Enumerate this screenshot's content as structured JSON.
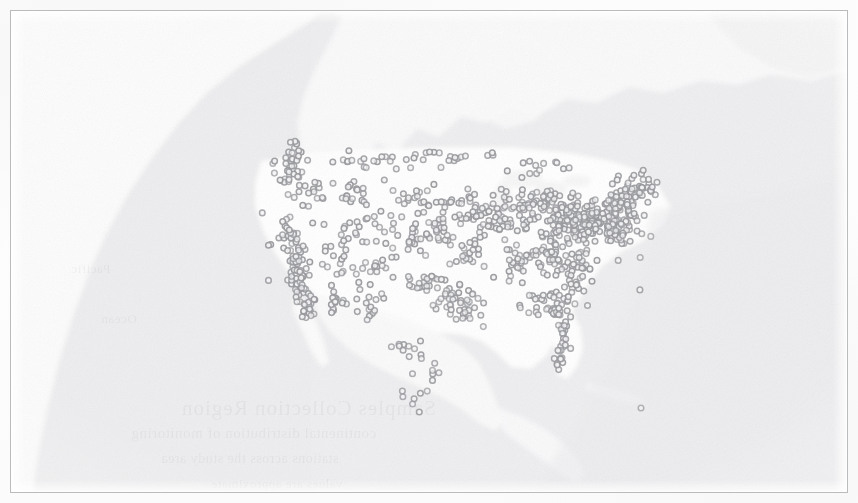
{
  "figure": {
    "title": "",
    "caption": "",
    "kind": "dot-density scatter map",
    "region_label": "North America",
    "border_color": "#b9bbbd",
    "background_color": "#fcfcfc",
    "ocean_color": "#efeff0",
    "land_color": "#fdfdfd",
    "marker_color": "#9a9b9f",
    "marker_fill": "#f3f3f4",
    "marker_radius_px": 2.8,
    "marker_count": 612,
    "scan_artifact": "bleed-through ghost text from reverse page, illegible"
  },
  "ghost_text": {
    "line1": "Samples Collection Region",
    "line2": "continental distribution of monitoring",
    "line3": "stations across the study area",
    "line4": "values are approximate",
    "line5": "Pacific",
    "line6": "Ocean"
  },
  "chart_data": {
    "type": "scatter",
    "title": "Dot-density map of sampling locations across North America",
    "subtitle": "",
    "xlabel": "Longitude",
    "ylabel": "Latitude",
    "xlim": [
      -170,
      -50
    ],
    "ylim": [
      8,
      72
    ],
    "grid": false,
    "legend": null,
    "projection": "equirectangular (approx.)",
    "series": [
      {
        "name": "Sampling locations",
        "marker": "open circle",
        "color": "#9a9b9f",
        "point_count": 612,
        "density_notes": [
          "Highest density: Northeast / Mid-Atlantic corridor (Boston-New York-Washington)",
          "Secondary cluster: Great Lakes / Midwest (Chicago-Detroit-Cleveland)",
          "Secondary cluster: Pacific coast of California (San Francisco-Los Angeles-San Diego)",
          "Linear chain along Florida peninsula",
          "Sparse scatter across Mountain West and Great Plains",
          "Thin trail of points extending south into Mexico",
          "One isolated point in the western Atlantic",
          "No points in Canada north of the border band, none in Alaska"
        ]
      }
    ],
    "clusters": [
      {
        "label": "Northeast corridor",
        "approx_points": 170,
        "cx_pct": 69,
        "cy_pct": 44
      },
      {
        "label": "Great Lakes / Midwest",
        "approx_points": 95,
        "cx_pct": 57,
        "cy_pct": 42
      },
      {
        "label": "California coast",
        "approx_points": 70,
        "cx_pct": 33,
        "cy_pct": 50
      },
      {
        "label": "Southeast / Florida",
        "approx_points": 60,
        "cx_pct": 63,
        "cy_pct": 62
      },
      {
        "label": "Texas / Gulf",
        "approx_points": 45,
        "cx_pct": 50,
        "cy_pct": 60
      },
      {
        "label": "Pacific Northwest",
        "approx_points": 35,
        "cx_pct": 32,
        "cy_pct": 32
      },
      {
        "label": "Mountain West / Plains",
        "approx_points": 110,
        "cx_pct": 45,
        "cy_pct": 45
      },
      {
        "label": "Mexico trail",
        "approx_points": 22,
        "cx_pct": 47,
        "cy_pct": 76
      },
      {
        "label": "Atlantic outlier",
        "approx_points": 1,
        "cx_pct": 75,
        "cy_pct": 82
      }
    ]
  }
}
